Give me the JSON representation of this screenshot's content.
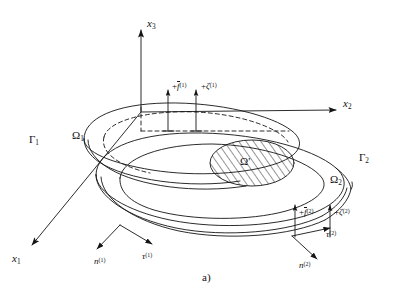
{
  "figure": {
    "caption": "a)",
    "axes": [
      {
        "id": "x3",
        "base": "x",
        "sub": "3",
        "direction": "up",
        "label": "x₃"
      },
      {
        "id": "x2",
        "base": "x",
        "sub": "2",
        "direction": "right",
        "label": "x₂"
      },
      {
        "id": "x1",
        "base": "x",
        "sub": "1",
        "direction": "down-left",
        "label": "x₁"
      }
    ],
    "domains": [
      {
        "id": "omega1",
        "base": "Ω",
        "sub": "1",
        "label": "Ω₁"
      },
      {
        "id": "omega2",
        "base": "Ω",
        "sub": "2",
        "label": "Ω₂"
      },
      {
        "id": "omegaP",
        "base": "Ω",
        "sub": "'",
        "label": "Ω'"
      }
    ],
    "boundaries": [
      {
        "id": "gamma1",
        "base": "Γ",
        "sub": "1",
        "label": "Γ₁"
      },
      {
        "id": "gamma2",
        "base": "Γ",
        "sub": "2",
        "label": "Γ₂"
      }
    ],
    "loads": [
      {
        "id": "f1",
        "sign": "+",
        "symbol": "f",
        "overbar": true,
        "sup": "(1)",
        "label": "+f̄⁽¹⁾"
      },
      {
        "id": "zeta1",
        "sign": "+",
        "symbol": "ζ",
        "overbar": false,
        "sup": "(1)",
        "label": "+ζ⁽¹⁾"
      },
      {
        "id": "f2",
        "sign": "+",
        "symbol": "f",
        "overbar": true,
        "sup": "(2)",
        "label": "+f̄⁽²⁾"
      },
      {
        "id": "zeta2",
        "sign": "+",
        "symbol": "ζ",
        "overbar": false,
        "sup": "(2)",
        "label": "+ζ⁽²⁾"
      }
    ],
    "vectors": [
      {
        "id": "n1",
        "symbol": "n",
        "sup": "(1)",
        "label": "n⁽¹⁾"
      },
      {
        "id": "tau1",
        "symbol": "τ",
        "sup": "(1)",
        "label": "τ⁽¹⁾"
      },
      {
        "id": "n2",
        "symbol": "n",
        "sup": "(2)",
        "label": "n⁽²⁾"
      },
      {
        "id": "tau2",
        "symbol": "τ",
        "sup": "(2)",
        "label": "τ⁽²⁾"
      }
    ],
    "style": {
      "stroke": "#141414",
      "background": "#ffffff",
      "hatch_color": "#141414"
    }
  }
}
